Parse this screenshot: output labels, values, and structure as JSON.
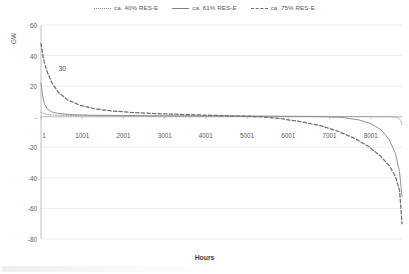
{
  "chart_data": {
    "type": "line",
    "title": "",
    "xlabel": "Hours",
    "ylabel": "GW",
    "xlim": [
      1,
      8760
    ],
    "ylim": [
      -80,
      60
    ],
    "grid": true,
    "legend_position": "top-center",
    "x_ticks": [
      {
        "value": 1,
        "label": "1"
      },
      {
        "value": 1001,
        "label": "1001"
      },
      {
        "value": 2001,
        "label": "2001"
      },
      {
        "value": 3001,
        "label": "3001"
      },
      {
        "value": 4001,
        "label": "4001"
      },
      {
        "value": 5001,
        "label": "5001"
      },
      {
        "value": 6001,
        "label": "6001"
      },
      {
        "value": 7001,
        "label": "7001"
      },
      {
        "value": 8001,
        "label": "8001"
      }
    ],
    "y_ticks": [
      {
        "value": 60,
        "label": "60"
      },
      {
        "value": 40,
        "label": "40"
      },
      {
        "value": 20,
        "label": "20"
      },
      {
        "value": 0,
        "label": "-"
      },
      {
        "value": -20,
        "label": "-20"
      },
      {
        "value": -40,
        "label": "-40"
      },
      {
        "value": -60,
        "label": "-60"
      },
      {
        "value": -80,
        "label": "-80"
      }
    ],
    "annotations": [
      {
        "text": "30",
        "x": 430,
        "y": 31
      }
    ],
    "series": [
      {
        "name": "ca. 40% RES-E",
        "style": "dotted",
        "color": "#9a9a9a",
        "x": [
          1,
          120,
          400,
          900,
          1600,
          2400,
          3200,
          4000,
          4800,
          5600,
          6400,
          7000,
          7600,
          8000,
          8300,
          8500,
          8650,
          8730,
          8760
        ],
        "y": [
          3.0,
          1.6,
          1.0,
          0.7,
          0.5,
          0.4,
          0.35,
          0.3,
          0.3,
          0.25,
          0.2,
          0.2,
          0.15,
          0.1,
          0.05,
          0.0,
          -0.6,
          -2.4,
          -5.0
        ]
      },
      {
        "name": "ca. 61% RES-E",
        "style": "solid",
        "color": "#8c8c8c",
        "x": [
          1,
          40,
          90,
          160,
          260,
          400,
          700,
          1200,
          2000,
          3000,
          4000,
          5000,
          5800,
          6400,
          6900,
          7300,
          7700,
          8000,
          8250,
          8450,
          8600,
          8700,
          8760
        ],
        "y": [
          22.0,
          13.5,
          8.0,
          5.0,
          3.2,
          2.2,
          1.4,
          1.0,
          0.8,
          0.6,
          0.5,
          0.4,
          0.3,
          0.2,
          0.0,
          -0.5,
          -2.0,
          -4.5,
          -8.5,
          -15.0,
          -24.0,
          -36.0,
          -52.0
        ]
      },
      {
        "name": "ca. 75% RES-E",
        "style": "dashed",
        "color": "#6e6e6e",
        "x": [
          1,
          60,
          140,
          260,
          420,
          650,
          950,
          1300,
          1700,
          2200,
          2800,
          3500,
          4200,
          4800,
          5300,
          5800,
          6300,
          6800,
          7200,
          7600,
          7950,
          8250,
          8450,
          8600,
          8700,
          8760
        ],
        "y": [
          48.0,
          38.0,
          30.0,
          22.5,
          16.0,
          11.0,
          7.5,
          5.2,
          3.8,
          2.8,
          2.0,
          1.4,
          0.9,
          0.4,
          0.0,
          -1.2,
          -3.2,
          -6.0,
          -9.5,
          -14.0,
          -19.5,
          -26.0,
          -32.0,
          -39.0,
          -48.0,
          -70.0
        ]
      }
    ]
  },
  "legend": {
    "items": [
      {
        "label": "ca. 40% RES-E",
        "style": "dotted"
      },
      {
        "label": "ca. 61% RES-E",
        "style": "solid"
      },
      {
        "label": "ca. 75% RES-E",
        "style": "dashed"
      }
    ]
  },
  "axis": {
    "y_title": "GW",
    "x_title": "Hours"
  },
  "colors": {
    "gridline": "#e4e4e4",
    "axis": "#b0b0b0",
    "text": "#595959"
  }
}
